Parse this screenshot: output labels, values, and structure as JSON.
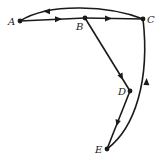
{
  "diagram": {
    "type": "directed-graph",
    "nodes": [
      {
        "id": "A",
        "label": "A",
        "x": 20,
        "y": 21
      },
      {
        "id": "B",
        "label": "B",
        "x": 85,
        "y": 18
      },
      {
        "id": "C",
        "label": "C",
        "x": 143,
        "y": 19
      },
      {
        "id": "D",
        "label": "D",
        "x": 130,
        "y": 91
      },
      {
        "id": "E",
        "label": "E",
        "x": 107,
        "y": 149
      }
    ],
    "edges": [
      {
        "from": "A",
        "to": "B",
        "shape": "straight"
      },
      {
        "from": "B",
        "to": "C",
        "shape": "straight"
      },
      {
        "from": "C",
        "to": "A",
        "shape": "curved"
      },
      {
        "from": "B",
        "to": "D",
        "shape": "straight"
      },
      {
        "from": "D",
        "to": "E",
        "shape": "straight"
      },
      {
        "from": "E",
        "to": "C",
        "shape": "curved"
      }
    ],
    "colors": {
      "stroke": "#1a1a1a",
      "background": "#ffffff"
    }
  }
}
